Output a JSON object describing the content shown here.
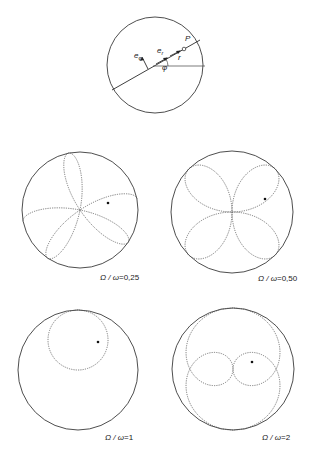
{
  "figure": {
    "colors": {
      "stroke": "#3a3a3a",
      "trajectory": "#555555",
      "background": "#ffffff"
    },
    "schematic": {
      "center": [
        153,
        66
      ],
      "radius": 48,
      "line_angle_deg": 29,
      "labels": {
        "e_phi": "e",
        "e_phi_sub": "φ",
        "e_r": "e",
        "e_r_sub": "r",
        "phi": "φ",
        "r": "r",
        "P": "P"
      }
    },
    "panels": [
      {
        "ratio": 0.25,
        "caption_lhs": "Ω / ω",
        "caption_eq": "=",
        "caption_val": "0,25",
        "center": [
          80,
          210
        ],
        "radius": 58,
        "caption_pos": [
          100,
          280
        ]
      },
      {
        "ratio": 0.5,
        "caption_lhs": "Ω / ω",
        "caption_eq": "=",
        "caption_val": "0,50",
        "center": [
          232,
          212
        ],
        "radius": 61,
        "caption_pos": [
          258,
          281
        ]
      },
      {
        "ratio": 1,
        "caption_lhs": "Ω / ω",
        "caption_eq": "=",
        "caption_val": "1",
        "center": [
          78,
          370
        ],
        "radius": 60,
        "caption_pos": [
          105,
          440
        ]
      },
      {
        "ratio": 2,
        "caption_lhs": "Ω / ω",
        "caption_eq": "=",
        "caption_val": "2",
        "center": [
          233,
          369
        ],
        "radius": 61,
        "caption_pos": [
          262,
          440
        ]
      }
    ]
  }
}
